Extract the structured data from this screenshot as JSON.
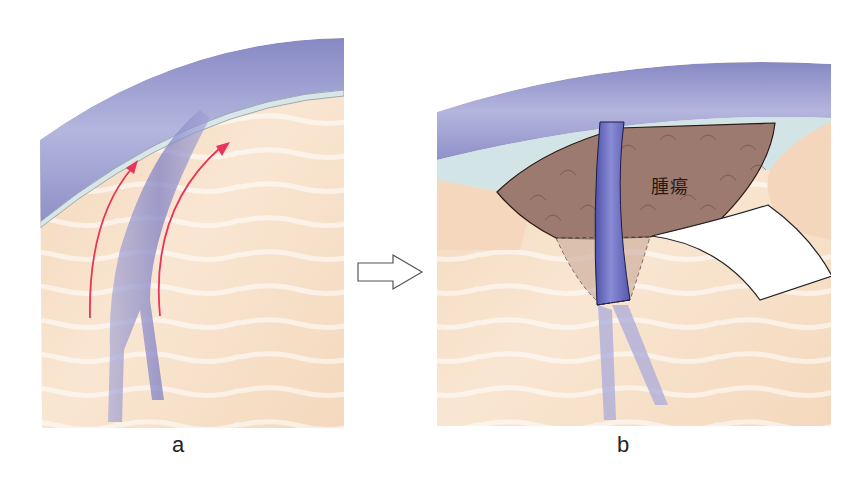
{
  "figure": {
    "panels": [
      {
        "id": "a",
        "label": "a",
        "description": "Dura and brain surface with vessel; red arrows indicate upward displacement along vessel"
      },
      {
        "id": "b",
        "label": "b",
        "description": "Tumor exposed beneath dura with vessel crossing; retractor spatula on right",
        "tumor_label": "腫瘍"
      }
    ],
    "transition_arrow": "right-arrow-outline"
  },
  "colors": {
    "dura": "#8e90c8",
    "arachnoid": "#cfe0e4",
    "brain": "#f6dcc2",
    "tumor": "#9c7a70",
    "vessel": "#6a6cc0",
    "arrow_red": "#e8335a",
    "retractor": "#ffffff"
  }
}
